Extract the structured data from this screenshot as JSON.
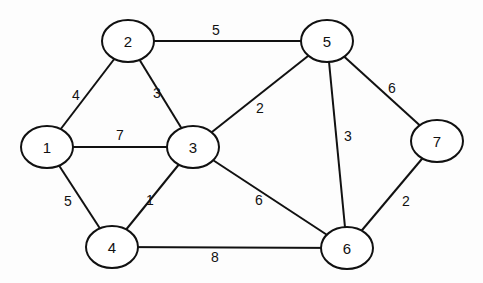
{
  "graph": {
    "nodes": [
      {
        "id": "1",
        "label": "1",
        "x": 47,
        "y": 147
      },
      {
        "id": "2",
        "label": "2",
        "x": 128,
        "y": 41
      },
      {
        "id": "3",
        "label": "3",
        "x": 193,
        "y": 147
      },
      {
        "id": "4",
        "label": "4",
        "x": 112,
        "y": 247
      },
      {
        "id": "5",
        "label": "5",
        "x": 327,
        "y": 41
      },
      {
        "id": "6",
        "label": "6",
        "x": 347,
        "y": 248
      },
      {
        "id": "7",
        "label": "7",
        "x": 437,
        "y": 141
      }
    ],
    "edges": [
      {
        "from": "1",
        "to": "2",
        "weight": "4",
        "lx": 76,
        "ly": 95
      },
      {
        "from": "1",
        "to": "3",
        "weight": "7",
        "lx": 120,
        "ly": 135
      },
      {
        "from": "1",
        "to": "4",
        "weight": "5",
        "lx": 68,
        "ly": 201
      },
      {
        "from": "2",
        "to": "3",
        "weight": "3",
        "lx": 157,
        "ly": 93
      },
      {
        "from": "2",
        "to": "5",
        "weight": "5",
        "lx": 216,
        "ly": 30
      },
      {
        "from": "3",
        "to": "4",
        "weight": "1",
        "lx": 150,
        "ly": 200
      },
      {
        "from": "3",
        "to": "5",
        "weight": "2",
        "lx": 260,
        "ly": 108
      },
      {
        "from": "3",
        "to": "6",
        "weight": "6",
        "lx": 259,
        "ly": 200
      },
      {
        "from": "4",
        "to": "6",
        "weight": "8",
        "lx": 215,
        "ly": 257
      },
      {
        "from": "5",
        "to": "6",
        "weight": "3",
        "lx": 348,
        "ly": 136
      },
      {
        "from": "5",
        "to": "7",
        "weight": "6",
        "lx": 392,
        "ly": 88
      },
      {
        "from": "6",
        "to": "7",
        "weight": "2",
        "lx": 406,
        "ly": 201
      }
    ]
  }
}
